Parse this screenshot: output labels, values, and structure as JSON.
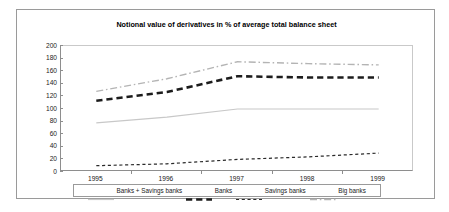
{
  "chart_data": {
    "type": "line",
    "title": "Notional value of derivatives in % of average total balance sheet",
    "xlabel": "",
    "ylabel": "",
    "x": [
      "1995",
      "1996",
      "1997",
      "1998",
      "1999"
    ],
    "categories": [
      "1995",
      "1996",
      "1997",
      "1998",
      "1999"
    ],
    "ylim": [
      0,
      200
    ],
    "ytick_step": 20,
    "yticks": [
      200,
      180,
      160,
      140,
      120,
      100,
      80,
      60,
      40,
      20,
      0
    ],
    "grid": false,
    "legend_position": "bottom",
    "series": [
      {
        "name": "Banks + Savings banks",
        "values": [
          78,
          87,
          100,
          100,
          100
        ],
        "color": "#c8c8c8",
        "style": "solid",
        "width": 1.2
      },
      {
        "name": "Banks",
        "values": [
          113,
          127,
          152,
          150,
          150
        ],
        "color": "#1c1c1c",
        "style": "dashed",
        "width": 2.6
      },
      {
        "name": "Savings banks",
        "values": [
          10,
          13,
          20,
          24,
          30
        ],
        "color": "#2a2a2a",
        "style": "dotted",
        "width": 1.2
      },
      {
        "name": "Big banks",
        "values": [
          128,
          148,
          175,
          172,
          170
        ],
        "color": "#b4b4b4",
        "style": "dashdot",
        "width": 1.4
      }
    ]
  },
  "legend": {
    "items": [
      {
        "label": "Banks + Savings banks",
        "icon": "line-solid-swatch"
      },
      {
        "label": "Banks",
        "icon": "line-dashed-swatch"
      },
      {
        "label": "Savings banks",
        "icon": "line-dotted-swatch"
      },
      {
        "label": "Big banks",
        "icon": "line-dashdot-swatch"
      }
    ]
  }
}
